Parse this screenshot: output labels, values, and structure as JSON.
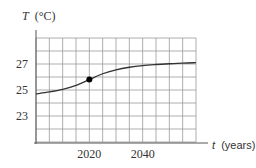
{
  "chart_data": {
    "type": "line",
    "title": "",
    "ylabel": "T (°C)",
    "ylabel_var": "T",
    "ylabel_unit": "(°C)",
    "xlabel": "t (years)",
    "xlabel_var": "t",
    "xlabel_unit": "(years)",
    "xlim": [
      2000,
      2060
    ],
    "ylim": [
      21,
      29
    ],
    "x_ticks": [
      2020,
      2040
    ],
    "x_tick_labels": [
      "2020",
      "2040"
    ],
    "y_ticks": [
      23,
      25,
      27
    ],
    "y_tick_labels": [
      "23",
      "25",
      "27"
    ],
    "grid": true,
    "grid_x_step": 5,
    "grid_y_step": 1,
    "legend": null,
    "series": [
      {
        "name": "Temperature",
        "x": [
          2000,
          2005,
          2010,
          2015,
          2020,
          2025,
          2030,
          2035,
          2040,
          2045,
          2050,
          2055,
          2060
        ],
        "values": [
          24.7,
          24.85,
          25.05,
          25.35,
          25.8,
          26.25,
          26.55,
          26.75,
          26.88,
          26.96,
          27.02,
          27.07,
          27.1
        ]
      }
    ],
    "annotations": [
      {
        "type": "point",
        "x": 2020,
        "y": 25.8,
        "style": "filled-dot"
      }
    ]
  },
  "colors": {
    "grid": "#9a9a9a",
    "axis": "#555555",
    "curve": "#333333",
    "point": "#000000"
  }
}
